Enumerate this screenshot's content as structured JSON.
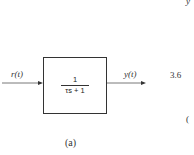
{
  "diagram": {
    "input_label": "r(t)",
    "output_label": "y(t)",
    "block": {
      "numerator": "1",
      "denominator": "τs + 1"
    },
    "caption": "(a)"
  },
  "cropped_right": {
    "top_fragment": "y",
    "middle_fragment": "3.6",
    "bottom_fragment": "("
  }
}
